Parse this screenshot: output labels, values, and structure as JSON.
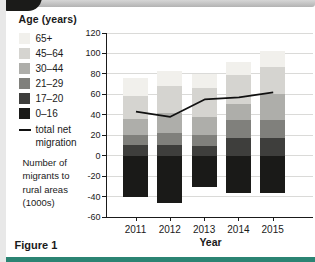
{
  "page": {
    "figure_label": "Figure 1"
  },
  "chart_data": {
    "type": "bar",
    "subtype": "stacked-bar-with-line",
    "legend_title": "Age (years)",
    "xlabel": "Year",
    "ylabel": "Number of migrants to rural areas (1000s)",
    "ylim": [
      -60,
      120
    ],
    "ytick_step": 20,
    "grid": true,
    "legend_position": "left",
    "categories": [
      "2011",
      "2012",
      "2013",
      "2014",
      "2015"
    ],
    "series": [
      {
        "name": "65+",
        "color": "#f1f0ec",
        "values": [
          18,
          15,
          14,
          13,
          15
        ]
      },
      {
        "name": "45–64",
        "color": "#d5d4d0",
        "values": [
          22,
          26,
          28,
          28,
          27
        ]
      },
      {
        "name": "30–44",
        "color": "#aeaeaa",
        "values": [
          16,
          20,
          18,
          16,
          25
        ]
      },
      {
        "name": "21–29",
        "color": "#80807c",
        "values": [
          10,
          12,
          11,
          18,
          18
        ]
      },
      {
        "name": "17–20",
        "color": "#3e3e3c",
        "values": [
          10,
          10,
          9,
          17,
          17
        ]
      },
      {
        "name": "0–16",
        "color": "#1a1a18",
        "values": [
          -40,
          -46,
          -31,
          -37,
          -37
        ]
      }
    ],
    "line_series": {
      "name": "total net migration",
      "color": "#111111",
      "values": [
        43,
        38,
        55,
        57,
        62
      ]
    }
  }
}
